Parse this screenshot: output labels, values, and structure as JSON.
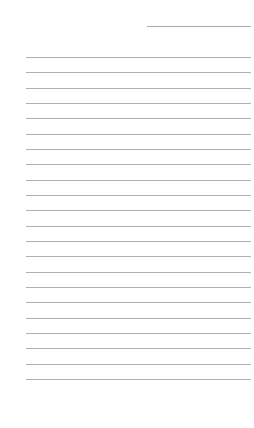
{
  "page": {
    "type": "lined-paper",
    "background": "#ffffff",
    "line_color": "#b0b0b0",
    "header_line": {
      "label": "date-line",
      "text": ""
    },
    "rules": {
      "count": 22,
      "first_y": 57,
      "spacing": 15.33,
      "lines": [
        "",
        "",
        "",
        "",
        "",
        "",
        "",
        "",
        "",
        "",
        "",
        "",
        "",
        "",
        "",
        "",
        "",
        "",
        "",
        "",
        "",
        ""
      ]
    }
  }
}
